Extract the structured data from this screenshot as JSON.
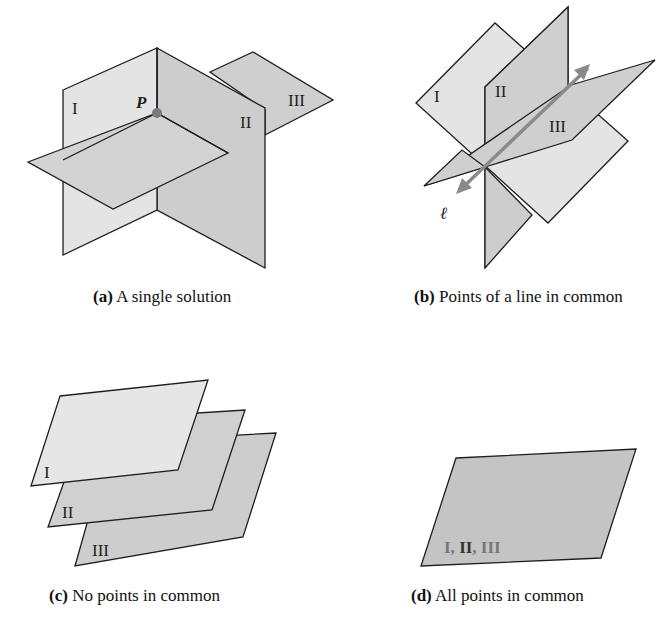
{
  "colors": {
    "light_plane": "#e6e6e6",
    "mid_plane": "#d0d0d0",
    "dark_plane": "#c4c4c4",
    "edge": "#1e1e1e",
    "point": "#7a7a7a",
    "line_arrow": "#8a8a8a",
    "label_gray": "#777777"
  },
  "panels": {
    "a": {
      "caption_letter": "(a)",
      "caption_text": " A single solution",
      "labels": {
        "plane1": "I",
        "plane2": "II",
        "plane3": "III",
        "point": "P"
      }
    },
    "b": {
      "caption_letter": "(b)",
      "caption_text": " Points of a line in common",
      "labels": {
        "plane1": "I",
        "plane2": "II",
        "plane3": "III",
        "line": "ℓ"
      }
    },
    "c": {
      "caption_letter": "(c)",
      "caption_text": " No points in common",
      "labels": {
        "plane1": "I",
        "plane2": "II",
        "plane3": "III"
      }
    },
    "d": {
      "caption_letter": "(d)",
      "caption_text": " All points in common",
      "labels": {
        "part1": "I, ",
        "part2": "II",
        "part3": ", III"
      }
    }
  }
}
